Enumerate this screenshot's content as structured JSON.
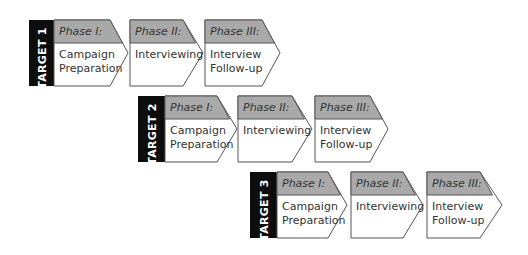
{
  "colors": {
    "target_bg": "#0d0d0d",
    "target_text": "#ffffff",
    "header_fill": "#a9a9a9",
    "body_fill": "#ffffff",
    "outline": "#555555",
    "text": "#333333"
  },
  "targets": [
    {
      "label": "TARGET 1",
      "phases": [
        {
          "title": "Phase I:",
          "line1": "Campaign",
          "line2": "Preparation"
        },
        {
          "title": "Phase II:",
          "line1": "Interviewing",
          "line2": ""
        },
        {
          "title": "Phase III:",
          "line1": "Interview",
          "line2": "Follow-up"
        }
      ]
    },
    {
      "label": "TARGET 2",
      "phases": [
        {
          "title": "Phase I:",
          "line1": "Campaign",
          "line2": "Preparation"
        },
        {
          "title": "Phase II:",
          "line1": "Interviewing",
          "line2": ""
        },
        {
          "title": "Phase III:",
          "line1": "Interview",
          "line2": "Follow-up"
        }
      ]
    },
    {
      "label": "TARGET 3",
      "phases": [
        {
          "title": "Phase I:",
          "line1": "Campaign",
          "line2": "Preparation"
        },
        {
          "title": "Phase II:",
          "line1": "Interviewing",
          "line2": ""
        },
        {
          "title": "Phase III:",
          "line1": "Interview",
          "line2": "Follow-up"
        }
      ]
    }
  ]
}
